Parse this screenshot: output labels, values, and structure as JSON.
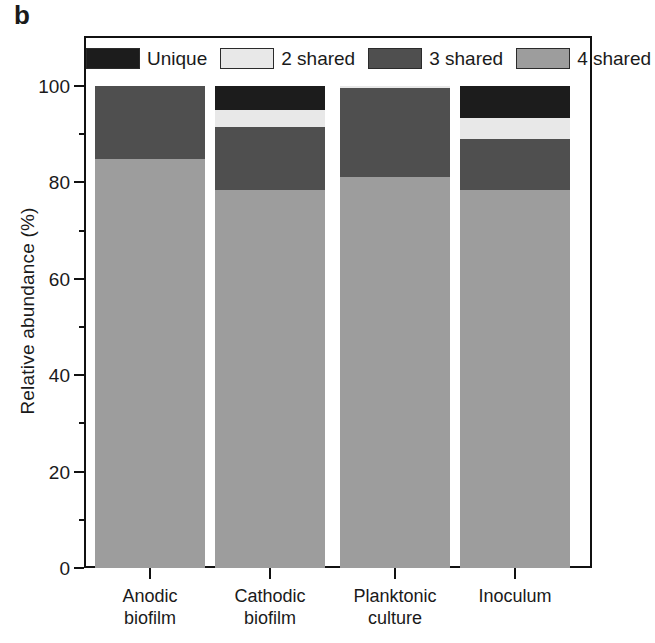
{
  "figure": {
    "panel_label": "b"
  },
  "chart_data": {
    "type": "bar",
    "subtype": "stacked-bar-100-percent",
    "title": "",
    "xlabel": "",
    "ylabel": "Relative abundance (%)",
    "ylim": [
      0,
      100
    ],
    "yticks": [
      0,
      20,
      40,
      60,
      80,
      100
    ],
    "ytick_labels": [
      "0",
      "20",
      "40",
      "60",
      "80",
      "100"
    ],
    "yminor_ticks": [
      10,
      30,
      50,
      70,
      90
    ],
    "grid": false,
    "legend_position": "top-inside",
    "categories": [
      "Anodic biofilm",
      "Cathodic biofilm",
      "Planktonic culture",
      "Inoculum"
    ],
    "category_lines": [
      [
        "Anodic",
        "biofilm"
      ],
      [
        "Cathodic",
        "biofilm"
      ],
      [
        "Planktonic",
        "culture"
      ],
      [
        "Inoculum",
        ""
      ]
    ],
    "series": [
      {
        "name": "4 shared",
        "color": "#9d9d9d",
        "values": [
          84.9,
          78.4,
          81.1,
          78.4
        ]
      },
      {
        "name": "3 shared",
        "color": "#4f4f4f",
        "values": [
          15.1,
          13.0,
          18.4,
          10.6
        ]
      },
      {
        "name": "2 shared",
        "color": "#e8e8e8",
        "values": [
          0.0,
          3.6,
          0.5,
          4.4
        ]
      },
      {
        "name": "Unique",
        "color": "#1c1c1c",
        "values": [
          0.0,
          5.0,
          0.0,
          6.6
        ]
      }
    ],
    "legend": [
      {
        "label": "Unique",
        "color": "#1c1c1c"
      },
      {
        "label": "2 shared",
        "color": "#e8e8e8"
      },
      {
        "label": "3 shared",
        "color": "#4f4f4f"
      },
      {
        "label": "4 shared",
        "color": "#9d9d9d"
      }
    ]
  },
  "colors": {
    "axis": "#111111",
    "text": "#1a1a1a",
    "background": "#ffffff"
  }
}
